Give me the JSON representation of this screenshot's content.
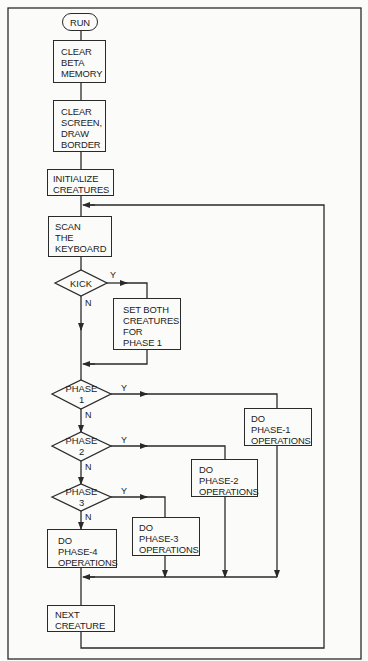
{
  "flowchart": {
    "start": {
      "label": "RUN"
    },
    "steps": {
      "clear_beta": {
        "lines": [
          "CLEAR",
          "BETA",
          "MEMORY"
        ]
      },
      "clear_screen": {
        "lines": [
          "CLEAR",
          "SCREEN,",
          "DRAW",
          "BORDER"
        ]
      },
      "initialize": {
        "lines": [
          "INITIALIZE",
          "CREATURES"
        ]
      },
      "scan": {
        "lines": [
          "SCAN",
          "THE",
          "KEYBOARD"
        ]
      },
      "set_both": {
        "lines": [
          "SET BOTH",
          "CREATURES",
          "FOR",
          "PHASE 1"
        ]
      },
      "phase1_ops": {
        "lines": [
          "DO",
          "PHASE-1",
          "OPERATIONS"
        ]
      },
      "phase2_ops": {
        "lines": [
          "DO",
          "PHASE-2",
          "OPERATIONS"
        ]
      },
      "phase3_ops": {
        "lines": [
          "DO",
          "PHASE-3",
          "OPERATIONS"
        ]
      },
      "phase4_ops": {
        "lines": [
          "DO",
          "PHASE-4",
          "OPERATIONS"
        ]
      },
      "next_creature": {
        "lines": [
          "NEXT",
          "CREATURE"
        ]
      }
    },
    "decisions": {
      "kick": {
        "lines": [
          "KICK"
        ],
        "yes": "Y",
        "no": "N"
      },
      "phase1": {
        "lines": [
          "PHASE",
          "1"
        ],
        "yes": "Y",
        "no": "N"
      },
      "phase2": {
        "lines": [
          "PHASE",
          "2"
        ],
        "yes": "Y",
        "no": "N"
      },
      "phase3": {
        "lines": [
          "PHASE",
          "3"
        ],
        "yes": "Y",
        "no": "N"
      }
    },
    "colors": {
      "line": "#2a2a2a",
      "background": "#fbfbfa"
    }
  }
}
